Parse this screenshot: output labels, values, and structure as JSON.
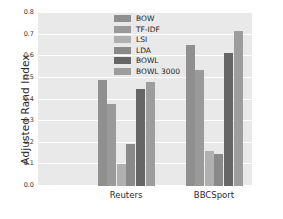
{
  "chart_data": {
    "type": "bar",
    "title": "",
    "xlabel": "",
    "ylabel": "Adjusted Rand Index",
    "categories": [
      "Reuters",
      "BBCSport"
    ],
    "ylim": [
      0.0,
      0.8
    ],
    "ytick_labels": [
      "0.0",
      "0.1",
      "0.2",
      "0.3",
      "0.4",
      "0.5",
      "0.6",
      "0.7",
      "0.8"
    ],
    "ytick_values": [
      0.0,
      0.1,
      0.2,
      0.3,
      0.4,
      0.5,
      0.6,
      0.7,
      0.8
    ],
    "grid": true,
    "legend_position": "upper center",
    "series": [
      {
        "name": "BOW",
        "color": "#8f8f8f",
        "values": [
          0.49,
          0.65
        ]
      },
      {
        "name": "TF-IDF",
        "color": "#9a9a9a",
        "values": [
          0.38,
          0.535
        ]
      },
      {
        "name": "LSI",
        "color": "#b0b0b0",
        "values": [
          0.1,
          0.16
        ]
      },
      {
        "name": "LDA",
        "color": "#8a8a8a",
        "values": [
          0.195,
          0.148
        ]
      },
      {
        "name": "BOWL",
        "color": "#666666",
        "values": [
          0.45,
          0.615
        ]
      },
      {
        "name": "BOWL 3000",
        "color": "#9d9d9d",
        "values": [
          0.48,
          0.715
        ]
      }
    ]
  },
  "style": {
    "plot_background": "#e9e9e9",
    "grid_color": "#ffffff",
    "figure_background": "#ffffff",
    "text_color": "#2b2b2b"
  }
}
